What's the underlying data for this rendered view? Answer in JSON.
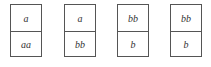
{
  "cards": [
    {
      "top": "a",
      "bottom": "aa"
    },
    {
      "top": "a",
      "bottom": "bb"
    },
    {
      "top": "bb",
      "bottom": "b"
    },
    {
      "top": "bb",
      "bottom": "b"
    }
  ]
}
